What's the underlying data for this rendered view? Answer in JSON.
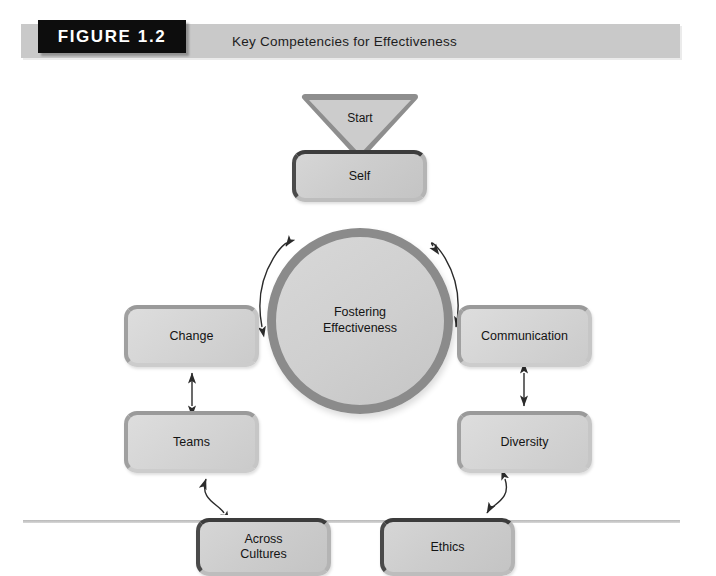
{
  "figure": {
    "badge": "FIGURE 1.2",
    "title": "Key Competencies for Effectiveness"
  },
  "diagram": {
    "type": "cycle-diagram",
    "start_label": "Start",
    "center": {
      "line1": "Fostering",
      "line2": "Effectiveness"
    },
    "nodes": [
      {
        "id": "self",
        "label": "Self"
      },
      {
        "id": "communication",
        "label": "Communication"
      },
      {
        "id": "diversity",
        "label": "Diversity"
      },
      {
        "id": "ethics",
        "label": "Ethics"
      },
      {
        "id": "across",
        "line1": "Across",
        "line2": "Cultures"
      },
      {
        "id": "teams",
        "label": "Teams"
      },
      {
        "id": "change",
        "label": "Change"
      }
    ],
    "connections": [
      {
        "from": "change",
        "to": "self",
        "style": "curved-double-arrow"
      },
      {
        "from": "self",
        "to": "communication",
        "style": "curved-double-arrow"
      },
      {
        "from": "communication",
        "to": "diversity",
        "style": "straight-double-arrow"
      },
      {
        "from": "diversity",
        "to": "ethics",
        "style": "curved-double-arrow"
      },
      {
        "from": "ethics",
        "to": "across",
        "style": "straight-double-arrow"
      },
      {
        "from": "across",
        "to": "teams",
        "style": "curved-double-arrow"
      },
      {
        "from": "teams",
        "to": "change",
        "style": "straight-double-arrow"
      }
    ]
  },
  "colors": {
    "badge_background": "#0d0d0d",
    "header_band": "#c9c9c9",
    "box_fill": "#cfcfcf",
    "box_border_dark": "#3c3c3c",
    "circle_border": "#8b8b8b",
    "arrow": "#2b2b2b"
  }
}
